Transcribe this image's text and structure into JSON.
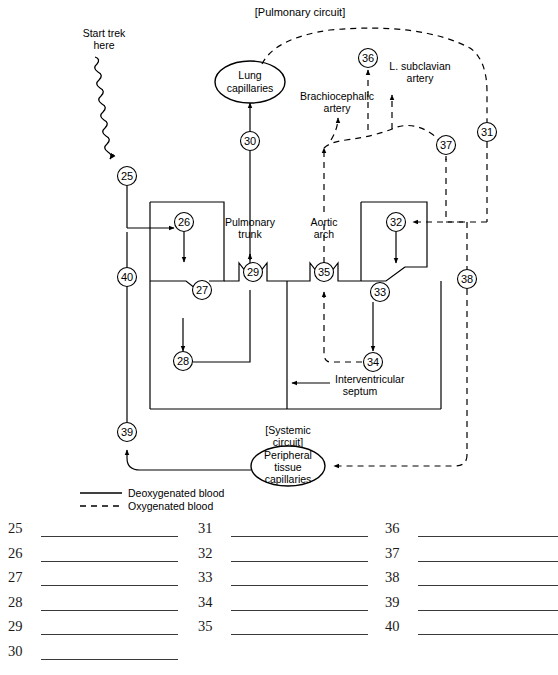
{
  "figure": {
    "title_pulmonary": "[Pulmonary circuit]",
    "title_systemic_line1": "[Systemic",
    "title_systemic_line2": "circuit]",
    "start_label_line1": "Start trek",
    "start_label_line2": "here"
  },
  "structures": {
    "lung_capillaries_line1": "Lung",
    "lung_capillaries_line2": "capillaries",
    "peripheral_line1": "Peripheral",
    "peripheral_line2": "tissue",
    "peripheral_line3": "capillaries",
    "pulmonary_trunk_line1": "Pulmonary",
    "pulmonary_trunk_line2": "trunk",
    "aortic_arch_line1": "Aortic",
    "aortic_arch_line2": "arch",
    "brachiocephalic_line1": "Brachiocephalic",
    "brachiocephalic_line2": "artery",
    "subclavian_line1": "L. subclavian",
    "subclavian_line2": "artery",
    "septum_line1": "Interventricular",
    "septum_line2": "septum"
  },
  "legend": {
    "deoxygenated": "Deoxygenated blood",
    "oxygenated": "Oxygenated blood"
  },
  "callouts": [
    {
      "id": "25",
      "x": 127,
      "y": 176
    },
    {
      "id": "26",
      "x": 184,
      "y": 222
    },
    {
      "id": "27",
      "x": 202,
      "y": 290
    },
    {
      "id": "28",
      "x": 183,
      "y": 361
    },
    {
      "id": "29",
      "x": 253,
      "y": 272
    },
    {
      "id": "30",
      "x": 250,
      "y": 141
    },
    {
      "id": "31",
      "x": 487,
      "y": 132
    },
    {
      "id": "32",
      "x": 396,
      "y": 222
    },
    {
      "id": "33",
      "x": 380,
      "y": 292
    },
    {
      "id": "34",
      "x": 373,
      "y": 362
    },
    {
      "id": "35",
      "x": 324,
      "y": 272
    },
    {
      "id": "36",
      "x": 368,
      "y": 58
    },
    {
      "id": "37",
      "x": 446,
      "y": 145
    },
    {
      "id": "38",
      "x": 467,
      "y": 279
    },
    {
      "id": "39",
      "x": 127,
      "y": 432
    },
    {
      "id": "40",
      "x": 127,
      "y": 277
    }
  ],
  "answers": {
    "columns": [
      {
        "numbers": [
          "25",
          "26",
          "27",
          "28",
          "29",
          "30"
        ]
      },
      {
        "numbers": [
          "31",
          "32",
          "33",
          "34",
          "35"
        ]
      },
      {
        "numbers": [
          "36",
          "37",
          "38",
          "39",
          "40"
        ]
      }
    ]
  },
  "colors": {
    "ink": "#000000",
    "line": "#3a3a3a",
    "background": "#ffffff"
  }
}
